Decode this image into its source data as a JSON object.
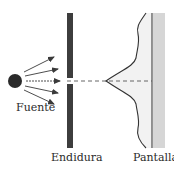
{
  "diagram": {
    "labels": {
      "source": "Fuente",
      "slit": "Endidura",
      "screen": "Pantalla"
    },
    "colors": {
      "source": "#2a2a2a",
      "barrier": "#3d3d3d",
      "arrows": "#3a3a3a",
      "axis_dashed": "#555555",
      "intensity_curve": "#333333",
      "intensity_fill": "#f2f2f2",
      "screen_line": "#2a2a2a",
      "screen_fill": "#d6d6d6"
    },
    "elements": {
      "source_circle": {
        "cx": 15,
        "cy": 81,
        "r": 7
      },
      "arrow_count": 5,
      "barrier": {
        "x": 67,
        "width": 6,
        "top": 13,
        "bottom": 148,
        "gap_top": 78,
        "gap_bottom": 84
      },
      "screen": {
        "x": 152,
        "top": 13,
        "bottom": 148,
        "fill_width": 12
      },
      "central_peak": {
        "x": 106,
        "y": 81
      }
    }
  }
}
